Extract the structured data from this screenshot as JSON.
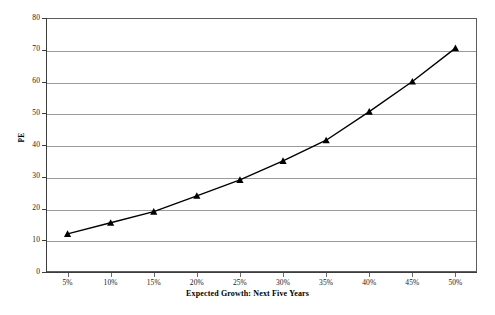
{
  "chart_data": {
    "type": "line",
    "title": "",
    "xlabel": "Expected Growth: Next Five Years",
    "ylabel": "PE",
    "x": [
      5,
      10,
      15,
      20,
      25,
      30,
      35,
      40,
      45,
      50
    ],
    "x_tick_labels": [
      "5%",
      "10%",
      "15%",
      "20%",
      "25%",
      "30%",
      "35%",
      "40%",
      "45%",
      "50%"
    ],
    "values": [
      12,
      15.5,
      19,
      24,
      29,
      35,
      41.5,
      50.5,
      60,
      70.5
    ],
    "series": [
      {
        "name": "PE",
        "values": [
          12,
          15.5,
          19,
          24,
          29,
          35,
          41.5,
          50.5,
          60,
          70.5
        ],
        "marker": "triangle",
        "marker_color": "#000000",
        "line_color": "#000000"
      }
    ],
    "y_tick_labels": [
      "0",
      "10",
      "20",
      "30",
      "40",
      "50",
      "60",
      "70",
      "80"
    ],
    "y_ticks": [
      0,
      10,
      20,
      30,
      40,
      50,
      60,
      70,
      80
    ],
    "ylim": [
      0,
      80
    ],
    "xlim": [
      2.5,
      52.5
    ],
    "grid": "horizontal",
    "legend": "none",
    "colors": {
      "line": "#000000",
      "marker": "#000000",
      "gridline": "#9a9a9a",
      "border": "#5d5d5d",
      "axis": "#3d3d3d",
      "background": "#ffffff",
      "text": "#1a1a1a"
    }
  },
  "footer": {
    "note": ""
  }
}
